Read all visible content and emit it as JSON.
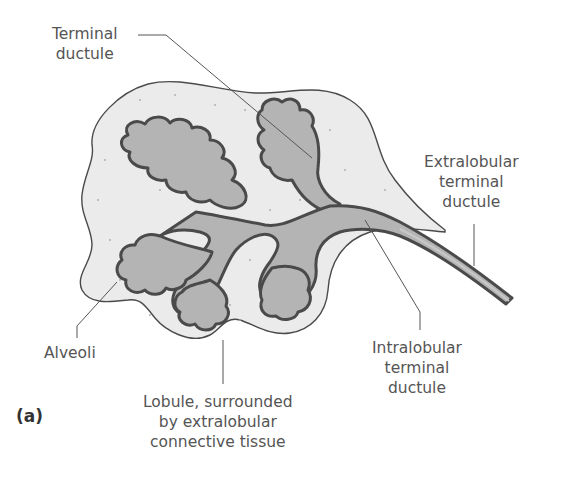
{
  "figure": {
    "panel_label": "(a)",
    "colors": {
      "connective_tissue": "#ebebeb",
      "lobule_fill": "#b4b4b4",
      "outline": "#4a4a4a",
      "leader_line": "#555555",
      "text": "#555555"
    }
  },
  "labels": {
    "terminal_ductule": [
      "Terminal",
      "ductule"
    ],
    "extralobular": [
      "Extralobular",
      "terminal",
      "ductule"
    ],
    "alveoli": [
      "Alveoli"
    ],
    "lobule": [
      "Lobule, surrounded",
      "by extralobular",
      "connective tissue"
    ],
    "intralobular": [
      "Intralobular",
      "terminal",
      "ductule"
    ]
  }
}
